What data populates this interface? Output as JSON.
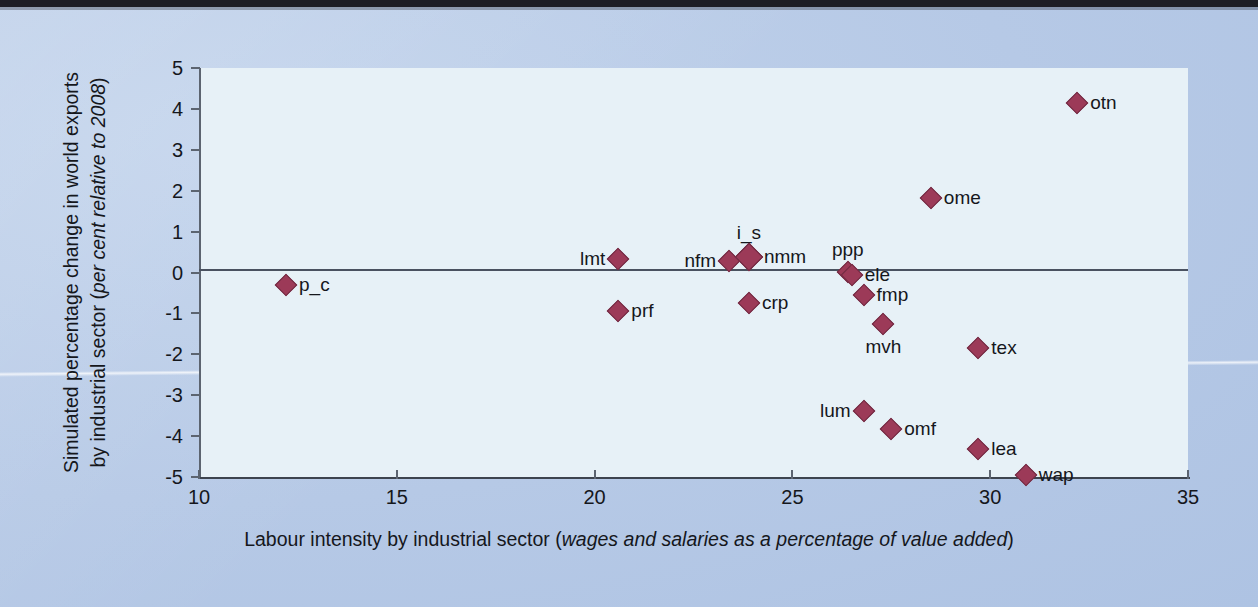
{
  "chart_data": {
    "type": "scatter",
    "title": "",
    "xlabel_plain": "Labour intensity by industrial sector (",
    "xlabel_italic": "wages and salaries as a percentage of value added",
    "xlabel_tail": ")",
    "ylabel_plain": "Simulated percentage change in world exports by industrial sector (",
    "ylabel_italic": "per cent relative to 2008",
    "ylabel_tail": ")",
    "xlim": [
      10,
      35
    ],
    "ylim": [
      -5,
      5
    ],
    "xticks": [
      "10",
      "15",
      "20",
      "25",
      "30",
      "35"
    ],
    "yticks": [
      "5",
      "4",
      "3",
      "2",
      "1",
      "0",
      "-1",
      "-2",
      "-3",
      "-4",
      "-5"
    ],
    "grid": false,
    "legend": "none",
    "zero_line": 0,
    "marker_color": "#9c3a58",
    "marker_edge_color": "#6f2a41",
    "plot_background": "#e7f1f7",
    "page_background": "#b6c9e6",
    "points": [
      {
        "label": "p_c",
        "x": 12.2,
        "y": -0.3,
        "label_pos": "right",
        "size": "normal"
      },
      {
        "label": "prf",
        "x": 20.6,
        "y": -0.95,
        "label_pos": "right",
        "size": "normal"
      },
      {
        "label": "lmt",
        "x": 20.6,
        "y": 0.33,
        "label_pos": "left",
        "size": "normal"
      },
      {
        "label": "nfm",
        "x": 23.4,
        "y": 0.27,
        "label_pos": "left",
        "size": "normal"
      },
      {
        "label": "i_s",
        "x": 23.9,
        "y": 0.38,
        "label_pos": "above",
        "size": "big"
      },
      {
        "label": "nmm",
        "x": 23.9,
        "y": 0.38,
        "label_pos": "right",
        "size": "big"
      },
      {
        "label": "crp",
        "x": 23.9,
        "y": -0.75,
        "label_pos": "right",
        "size": "normal"
      },
      {
        "label": "ppp",
        "x": 26.4,
        "y": 0.02,
        "label_pos": "above",
        "size": "normal"
      },
      {
        "label": "ele",
        "x": 26.5,
        "y": -0.05,
        "label_pos": "right",
        "size": "normal"
      },
      {
        "label": "fmp",
        "x": 26.8,
        "y": -0.55,
        "label_pos": "right",
        "size": "normal"
      },
      {
        "label": "mvh",
        "x": 27.3,
        "y": -1.25,
        "label_pos": "below",
        "size": "normal"
      },
      {
        "label": "tex",
        "x": 29.7,
        "y": -1.85,
        "label_pos": "right",
        "size": "normal"
      },
      {
        "label": "lum",
        "x": 26.8,
        "y": -3.38,
        "label_pos": "left",
        "size": "normal"
      },
      {
        "label": "omf",
        "x": 27.5,
        "y": -3.82,
        "label_pos": "right",
        "size": "normal"
      },
      {
        "label": "lea",
        "x": 29.7,
        "y": -4.32,
        "label_pos": "right",
        "size": "normal"
      },
      {
        "label": "wap",
        "x": 30.9,
        "y": -4.95,
        "label_pos": "right",
        "size": "normal"
      },
      {
        "label": "ome",
        "x": 28.5,
        "y": 1.83,
        "label_pos": "right",
        "size": "normal"
      },
      {
        "label": "otn",
        "x": 32.2,
        "y": 4.15,
        "label_pos": "right",
        "size": "normal"
      }
    ]
  }
}
